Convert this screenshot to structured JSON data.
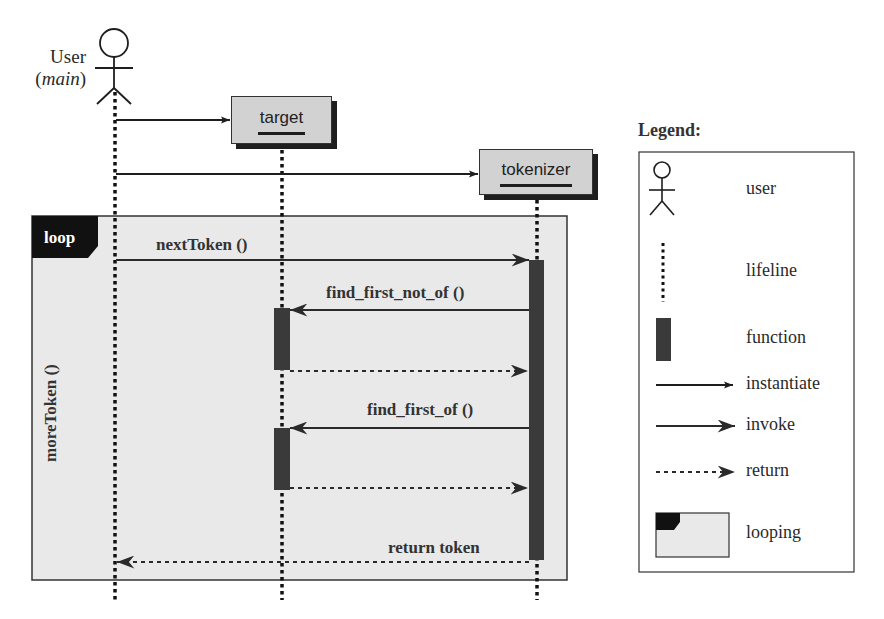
{
  "actor": {
    "name": "User",
    "role": "main",
    "icon": "stick-figure-icon"
  },
  "objects": [
    {
      "id": "target",
      "label": "target"
    },
    {
      "id": "tokenizer",
      "label": "tokenizer"
    }
  ],
  "loop": {
    "tag": "loop",
    "condition": "moreToken ()"
  },
  "messages": [
    {
      "label": "",
      "from": "User",
      "to": "target",
      "type": "instantiate"
    },
    {
      "label": "",
      "from": "User",
      "to": "tokenizer",
      "type": "instantiate"
    },
    {
      "label": "nextToken ()",
      "from": "User",
      "to": "tokenizer",
      "type": "invoke"
    },
    {
      "label": "find_first_not_of ()",
      "from": "tokenizer",
      "to": "target",
      "type": "invoke"
    },
    {
      "label": "",
      "from": "target",
      "to": "tokenizer",
      "type": "return"
    },
    {
      "label": "find_first_of ()",
      "from": "tokenizer",
      "to": "target",
      "type": "invoke"
    },
    {
      "label": "",
      "from": "target",
      "to": "tokenizer",
      "type": "return"
    },
    {
      "label": "return token",
      "from": "tokenizer",
      "to": "User",
      "type": "return"
    }
  ],
  "legend": {
    "title": "Legend:",
    "items": [
      {
        "icon": "stick-figure-icon",
        "label": "user"
      },
      {
        "icon": "dotted-line-icon",
        "label": "lifeline"
      },
      {
        "icon": "activation-bar-icon",
        "label": "function"
      },
      {
        "icon": "thin-arrow-icon",
        "label": "instantiate"
      },
      {
        "icon": "filled-arrow-icon",
        "label": "invoke"
      },
      {
        "icon": "dashed-arrow-icon",
        "label": "return"
      },
      {
        "icon": "loop-frame-icon",
        "label": "looping"
      }
    ]
  },
  "colors": {
    "frame_fill": "#e9e9e9",
    "object_fill": "#d2d2d2",
    "activation": "#3a3a3a",
    "ink": "#1e1e1e"
  }
}
